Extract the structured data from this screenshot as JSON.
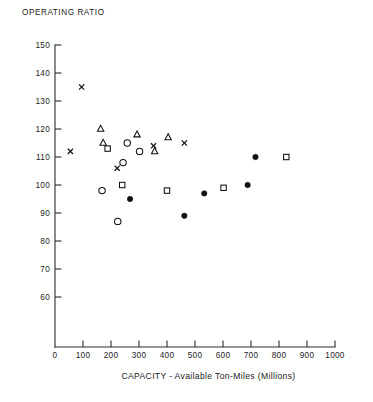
{
  "chart_data": {
    "type": "scatter",
    "title": "OPERATING RATIO",
    "xlabel": "CAPACITY - Available Ton-Miles (Millions)",
    "ylabel": "OPERATING RATIO",
    "xlim": [
      0,
      1000
    ],
    "ylim": [
      55,
      150
    ],
    "grid": false,
    "legend": "none",
    "xticks": [
      0,
      100,
      200,
      300,
      400,
      500,
      600,
      700,
      800,
      900,
      1000
    ],
    "xtick_labels": [
      "0",
      "100",
      "200",
      "300",
      "400",
      "500",
      "600",
      "700",
      "800",
      "900",
      "1000"
    ],
    "yticks": [
      60,
      70,
      80,
      90,
      100,
      110,
      120,
      130,
      140,
      150
    ],
    "ytick_labels": [
      "60",
      "70",
      "80",
      "90",
      "100",
      "110",
      "120",
      "130",
      "140",
      "150"
    ],
    "series": [
      {
        "name": "cross",
        "marker": "x",
        "filled": false,
        "points": [
          {
            "x": 95,
            "y": 135
          },
          {
            "x": 55,
            "y": 112
          },
          {
            "x": 222,
            "y": 106
          },
          {
            "x": 352,
            "y": 114
          },
          {
            "x": 462,
            "y": 115
          }
        ]
      },
      {
        "name": "triangle",
        "marker": "triangle",
        "filled": false,
        "points": [
          {
            "x": 163,
            "y": 120
          },
          {
            "x": 172,
            "y": 115
          },
          {
            "x": 293,
            "y": 118
          },
          {
            "x": 356,
            "y": 112
          },
          {
            "x": 404,
            "y": 117
          }
        ]
      },
      {
        "name": "square",
        "marker": "square",
        "filled": false,
        "points": [
          {
            "x": 188,
            "y": 113
          },
          {
            "x": 240,
            "y": 100
          },
          {
            "x": 400,
            "y": 98
          },
          {
            "x": 602,
            "y": 99
          },
          {
            "x": 826,
            "y": 110
          }
        ]
      },
      {
        "name": "circle-open",
        "marker": "circle",
        "filled": false,
        "points": [
          {
            "x": 258,
            "y": 115
          },
          {
            "x": 302,
            "y": 112
          },
          {
            "x": 243,
            "y": 108
          },
          {
            "x": 168,
            "y": 98
          },
          {
            "x": 224,
            "y": 87
          }
        ]
      },
      {
        "name": "circle-filled",
        "marker": "circle",
        "filled": true,
        "points": [
          {
            "x": 268,
            "y": 95
          },
          {
            "x": 462,
            "y": 89
          },
          {
            "x": 533,
            "y": 97
          },
          {
            "x": 688,
            "y": 100
          },
          {
            "x": 716,
            "y": 110
          }
        ]
      }
    ]
  }
}
